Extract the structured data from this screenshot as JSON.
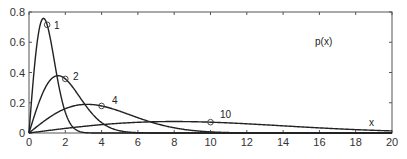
{
  "chart_data": {
    "type": "line",
    "title": "",
    "xlabel": "x",
    "ylabel": "p(x)",
    "xlim": [
      0,
      20
    ],
    "ylim": [
      0,
      0.8
    ],
    "grid": false,
    "legend": "inline curve labels",
    "x_ticks": [
      "0",
      "2",
      "4",
      "6",
      "8",
      "10",
      "12",
      "14",
      "16",
      "18",
      "20"
    ],
    "y_ticks": [
      "0",
      "0.2",
      "0.4",
      "0.6",
      "0.8"
    ],
    "series": [
      {
        "name": "1",
        "sigma": 0.8,
        "peak": {
          "x": 0.8,
          "y": 0.76
        },
        "marker": {
          "x": 1,
          "y": 0.72
        }
      },
      {
        "name": "2",
        "sigma": 1.6,
        "peak": {
          "x": 1.6,
          "y": 0.38
        },
        "marker": {
          "x": 2,
          "y": 0.36
        }
      },
      {
        "name": "4",
        "sigma": 3.2,
        "peak": {
          "x": 3.2,
          "y": 0.19
        },
        "marker": {
          "x": 4,
          "y": 0.18
        }
      },
      {
        "name": "10",
        "sigma": 8.0,
        "peak": {
          "x": 8.0,
          "y": 0.076
        },
        "marker": {
          "x": 10,
          "y": 0.072
        }
      }
    ]
  },
  "labels": {
    "y_axis": "p(x)",
    "x_axis": "x"
  }
}
